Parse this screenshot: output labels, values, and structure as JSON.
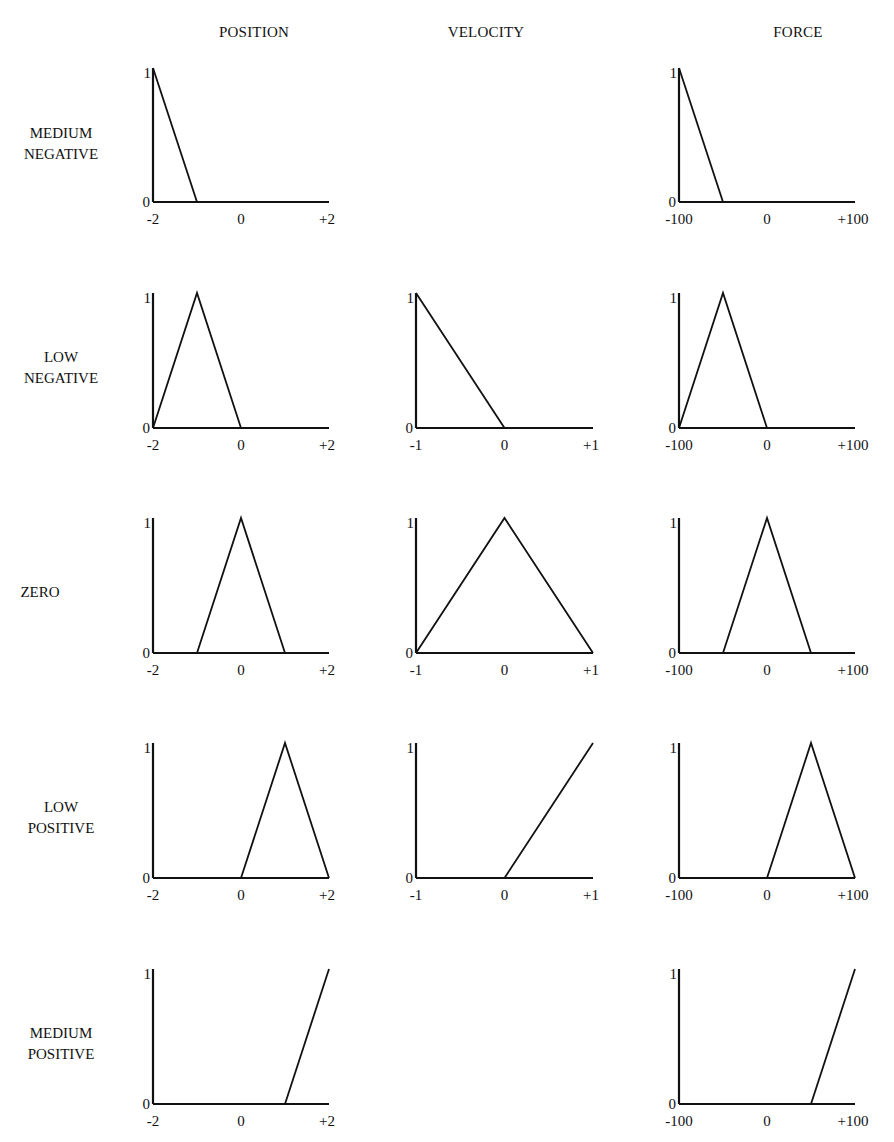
{
  "columns": [
    {
      "key": "position",
      "label": "POSITION",
      "ticks": [
        "-2",
        "0",
        "+2"
      ],
      "range": [
        -2,
        2
      ]
    },
    {
      "key": "velocity",
      "label": "VELOCITY",
      "ticks": [
        "-1",
        "0",
        "+1"
      ],
      "range": [
        -1,
        1
      ]
    },
    {
      "key": "force",
      "label": "FORCE",
      "ticks": [
        "-100",
        "0",
        "+100"
      ],
      "range": [
        -100,
        100
      ]
    }
  ],
  "rows": [
    {
      "key": "medium_negative",
      "label_line1": "MEDIUM",
      "label_line2": "NEGATIVE"
    },
    {
      "key": "low_negative",
      "label_line1": "LOW",
      "label_line2": "NEGATIVE"
    },
    {
      "key": "zero",
      "label_line1": "ZERO",
      "label_line2": ""
    },
    {
      "key": "low_positive",
      "label_line1": "LOW",
      "label_line2": "POSITIVE"
    },
    {
      "key": "medium_positive",
      "label_line1": "MEDIUM",
      "label_line2": "POSITIVE"
    }
  ],
  "y_ticks": [
    "0",
    "1"
  ],
  "colors": {
    "line": "#111111",
    "background": "#ffffff"
  },
  "chart_data": {
    "type": "line",
    "title": "",
    "ylabel": "membership",
    "ylim": [
      0,
      1
    ],
    "grid": false,
    "legend": null,
    "panels": [
      {
        "row": "MEDIUM NEGATIVE",
        "column": "POSITION",
        "xlim": [
          -2,
          2
        ],
        "x_ticks": [
          "-2",
          "0",
          "+2"
        ],
        "points": [
          [
            -2,
            1
          ],
          [
            -1,
            0
          ]
        ]
      },
      {
        "row": "MEDIUM NEGATIVE",
        "column": "VELOCITY",
        "empty": true
      },
      {
        "row": "MEDIUM NEGATIVE",
        "column": "FORCE",
        "xlim": [
          -100,
          100
        ],
        "x_ticks": [
          "-100",
          "0",
          "+100"
        ],
        "points": [
          [
            -100,
            1
          ],
          [
            -50,
            0
          ]
        ]
      },
      {
        "row": "LOW NEGATIVE",
        "column": "POSITION",
        "xlim": [
          -2,
          2
        ],
        "x_ticks": [
          "-2",
          "0",
          "+2"
        ],
        "points": [
          [
            -2,
            0
          ],
          [
            -1,
            1
          ],
          [
            0,
            0
          ]
        ]
      },
      {
        "row": "LOW NEGATIVE",
        "column": "VELOCITY",
        "xlim": [
          -1,
          1
        ],
        "x_ticks": [
          "-1",
          "0",
          "+1"
        ],
        "points": [
          [
            -1,
            1
          ],
          [
            0,
            0
          ]
        ]
      },
      {
        "row": "LOW NEGATIVE",
        "column": "FORCE",
        "xlim": [
          -100,
          100
        ],
        "x_ticks": [
          "-100",
          "0",
          "+100"
        ],
        "points": [
          [
            -100,
            0
          ],
          [
            -50,
            1
          ],
          [
            0,
            0
          ]
        ]
      },
      {
        "row": "ZERO",
        "column": "POSITION",
        "xlim": [
          -2,
          2
        ],
        "x_ticks": [
          "-2",
          "0",
          "+2"
        ],
        "points": [
          [
            -1,
            0
          ],
          [
            0,
            1
          ],
          [
            1,
            0
          ]
        ]
      },
      {
        "row": "ZERO",
        "column": "VELOCITY",
        "xlim": [
          -1,
          1
        ],
        "x_ticks": [
          "-1",
          "0",
          "+1"
        ],
        "points": [
          [
            -1,
            0
          ],
          [
            0,
            1
          ],
          [
            1,
            0
          ]
        ]
      },
      {
        "row": "ZERO",
        "column": "FORCE",
        "xlim": [
          -100,
          100
        ],
        "x_ticks": [
          "-100",
          "0",
          "+100"
        ],
        "points": [
          [
            -50,
            0
          ],
          [
            0,
            1
          ],
          [
            50,
            0
          ]
        ]
      },
      {
        "row": "LOW POSITIVE",
        "column": "POSITION",
        "xlim": [
          -2,
          2
        ],
        "x_ticks": [
          "-2",
          "0",
          "+2"
        ],
        "points": [
          [
            0,
            0
          ],
          [
            1,
            1
          ],
          [
            2,
            0
          ]
        ]
      },
      {
        "row": "LOW POSITIVE",
        "column": "VELOCITY",
        "xlim": [
          -1,
          1
        ],
        "x_ticks": [
          "-1",
          "0",
          "+1"
        ],
        "points": [
          [
            0,
            0
          ],
          [
            1,
            1
          ]
        ]
      },
      {
        "row": "LOW POSITIVE",
        "column": "FORCE",
        "xlim": [
          -100,
          100
        ],
        "x_ticks": [
          "-100",
          "0",
          "+100"
        ],
        "points": [
          [
            0,
            0
          ],
          [
            50,
            1
          ],
          [
            100,
            0
          ]
        ]
      },
      {
        "row": "MEDIUM POSITIVE",
        "column": "POSITION",
        "xlim": [
          -2,
          2
        ],
        "x_ticks": [
          "-2",
          "0",
          "+2"
        ],
        "points": [
          [
            1,
            0
          ],
          [
            2,
            1
          ]
        ]
      },
      {
        "row": "MEDIUM POSITIVE",
        "column": "VELOCITY",
        "empty": true
      },
      {
        "row": "MEDIUM POSITIVE",
        "column": "FORCE",
        "xlim": [
          -100,
          100
        ],
        "x_ticks": [
          "-100",
          "0",
          "+100"
        ],
        "points": [
          [
            50,
            0
          ],
          [
            100,
            1
          ]
        ]
      }
    ]
  }
}
